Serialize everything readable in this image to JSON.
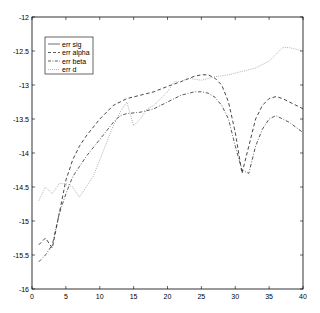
{
  "chart_data": {
    "type": "line",
    "title": "",
    "xlabel": "",
    "ylabel": "",
    "xlim": [
      0,
      40
    ],
    "ylim": [
      -16,
      -12
    ],
    "xticks": [
      0,
      5,
      10,
      15,
      20,
      25,
      30,
      35,
      40
    ],
    "yticks": [
      -12,
      -12.5,
      -13,
      -13.5,
      -14,
      -14.5,
      -15,
      -15.5,
      -16
    ],
    "xtick_labels": [
      "0",
      "5",
      "10",
      "15",
      "20",
      "25",
      "30",
      "35",
      "40"
    ],
    "ytick_labels": [
      "-12",
      "-12.5",
      "-13",
      "-13.5",
      "-14",
      "-14.5",
      "-15",
      "-15.5",
      "-16"
    ],
    "grid": false,
    "legend_position": "top-left",
    "series": [
      {
        "name": "err sig",
        "style": "solid",
        "x": [],
        "y": []
      },
      {
        "name": "err alpha",
        "style": "dashed",
        "x": [
          1,
          2,
          3,
          4,
          5,
          6,
          7,
          8,
          10,
          12,
          14,
          16,
          18,
          20,
          22,
          24,
          25,
          26,
          27,
          28,
          29,
          30,
          31,
          32,
          33,
          34,
          35,
          36,
          37,
          38,
          40
        ],
        "y": [
          -15.35,
          -15.25,
          -15.4,
          -14.9,
          -14.4,
          -14.1,
          -13.9,
          -13.75,
          -13.5,
          -13.3,
          -13.2,
          -13.15,
          -13.1,
          -13.02,
          -12.95,
          -12.87,
          -12.85,
          -12.85,
          -12.9,
          -13.0,
          -13.25,
          -13.7,
          -14.3,
          -13.9,
          -13.5,
          -13.3,
          -13.2,
          -13.17,
          -13.2,
          -13.25,
          -13.35
        ]
      },
      {
        "name": "err beta",
        "style": "dashdot",
        "x": [
          1,
          2,
          3,
          4,
          5,
          6,
          7,
          8,
          10,
          12,
          13,
          14,
          16,
          18,
          20,
          22,
          24,
          25,
          26,
          27,
          28,
          29,
          30,
          31,
          32,
          33,
          34,
          35,
          36,
          37,
          38,
          40
        ],
        "y": [
          -15.6,
          -15.5,
          -15.35,
          -14.9,
          -14.6,
          -14.35,
          -14.2,
          -14.05,
          -13.8,
          -13.55,
          -13.45,
          -13.42,
          -13.4,
          -13.35,
          -13.25,
          -13.15,
          -13.1,
          -13.1,
          -13.12,
          -13.18,
          -13.3,
          -13.5,
          -13.9,
          -14.25,
          -14.3,
          -13.9,
          -13.65,
          -13.5,
          -13.45,
          -13.5,
          -13.55,
          -13.7
        ]
      },
      {
        "name": "err d",
        "style": "dotted",
        "x": [
          1,
          2,
          3,
          4,
          5,
          6,
          7,
          8,
          9,
          10,
          11,
          12,
          13,
          14,
          15,
          16,
          17,
          18,
          19,
          20,
          21,
          22,
          23,
          25,
          27,
          29,
          31,
          33,
          35,
          36,
          37,
          38,
          40
        ],
        "y": [
          -14.7,
          -14.5,
          -14.6,
          -14.45,
          -14.45,
          -14.5,
          -14.65,
          -14.5,
          -14.35,
          -14.1,
          -13.85,
          -13.6,
          -13.4,
          -13.25,
          -13.6,
          -13.5,
          -13.35,
          -13.3,
          -13.2,
          -13.1,
          -12.95,
          -12.95,
          -12.9,
          -12.93,
          -12.88,
          -12.85,
          -12.8,
          -12.75,
          -12.65,
          -12.55,
          -12.45,
          -12.45,
          -12.5
        ]
      }
    ]
  }
}
